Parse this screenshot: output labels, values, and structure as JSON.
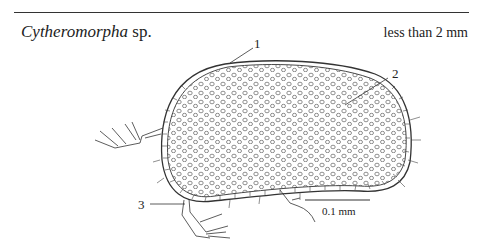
{
  "figure": {
    "title_italic": "Cytheromorpha",
    "title_suffix": " sp.",
    "size_note": "less than 2 mm",
    "labels": [
      "1",
      "2",
      "3"
    ],
    "scale_bar": {
      "label": "0.1 mm"
    },
    "colors": {
      "line": "#333333",
      "background": "#ffffff"
    }
  }
}
